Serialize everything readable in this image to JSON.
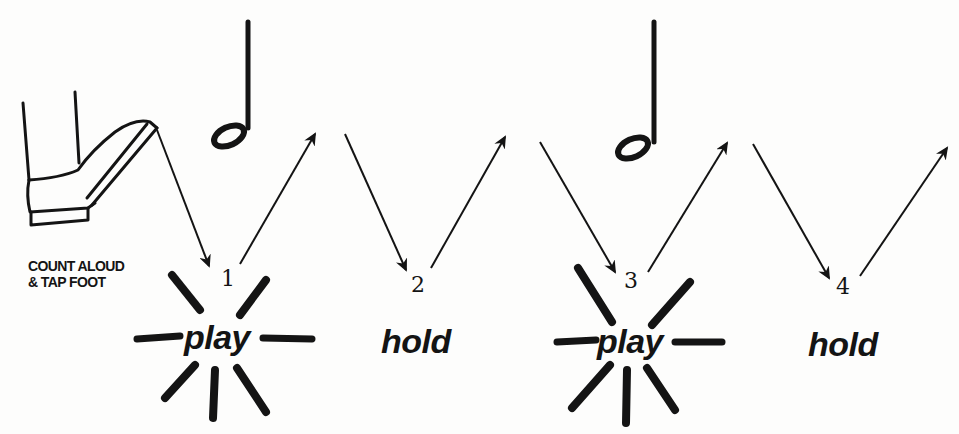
{
  "caption": {
    "line1": "COUNT ALOUD",
    "line2": "& TAP FOOT"
  },
  "beats": [
    {
      "number": "1",
      "action": "play"
    },
    {
      "number": "2",
      "action": "hold"
    },
    {
      "number": "3",
      "action": "play"
    },
    {
      "number": "4",
      "action": "hold"
    }
  ],
  "notes": [
    {
      "type": "half-note",
      "spans_beats": "1-2"
    },
    {
      "type": "half-note",
      "spans_beats": "3-4"
    }
  ],
  "colors": {
    "ink": "#141414",
    "paper": "#fdfdfc"
  }
}
